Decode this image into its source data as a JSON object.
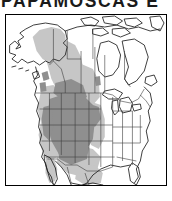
{
  "title": {
    "text": "PAPAMOSCAS E",
    "color": "#1a1a1a",
    "note": "cropped at top edge of screenshot"
  },
  "map": {
    "name": "north-america-range-map",
    "region": "North America",
    "background_color": "#ffffff",
    "border_color": "#000000",
    "coastline_color": "#1a1a1a",
    "boundary_color": "#3a3a3a",
    "legend_shades": [
      {
        "key": "breeding_range",
        "color": "#8c8c8c",
        "label": "dark gray"
      },
      {
        "key": "extended_range",
        "color": "#c2c2c2",
        "label": "light gray"
      }
    ],
    "landmasses": [
      "Alaska",
      "Canada",
      "Contiguous United States",
      "Mexico",
      "Greenland edge",
      "Canadian Arctic Archipelago",
      "Baja California",
      "Newfoundland",
      "Florida Peninsula",
      "Great Lakes"
    ],
    "shaded_dark_states": [
      "Montana",
      "Idaho",
      "Wyoming",
      "Nevada",
      "Utah",
      "Colorado",
      "Arizona",
      "New Mexico",
      "eastern Oregon",
      "eastern California",
      "western Nebraska"
    ],
    "shaded_light_regions": [
      "Alaska interior",
      "Yukon",
      "British Columbia",
      "Alberta",
      "western Saskatchewan",
      "Pacific Northwest",
      "California",
      "Texas panhandle",
      "northern Mexico",
      "Baja California"
    ]
  }
}
